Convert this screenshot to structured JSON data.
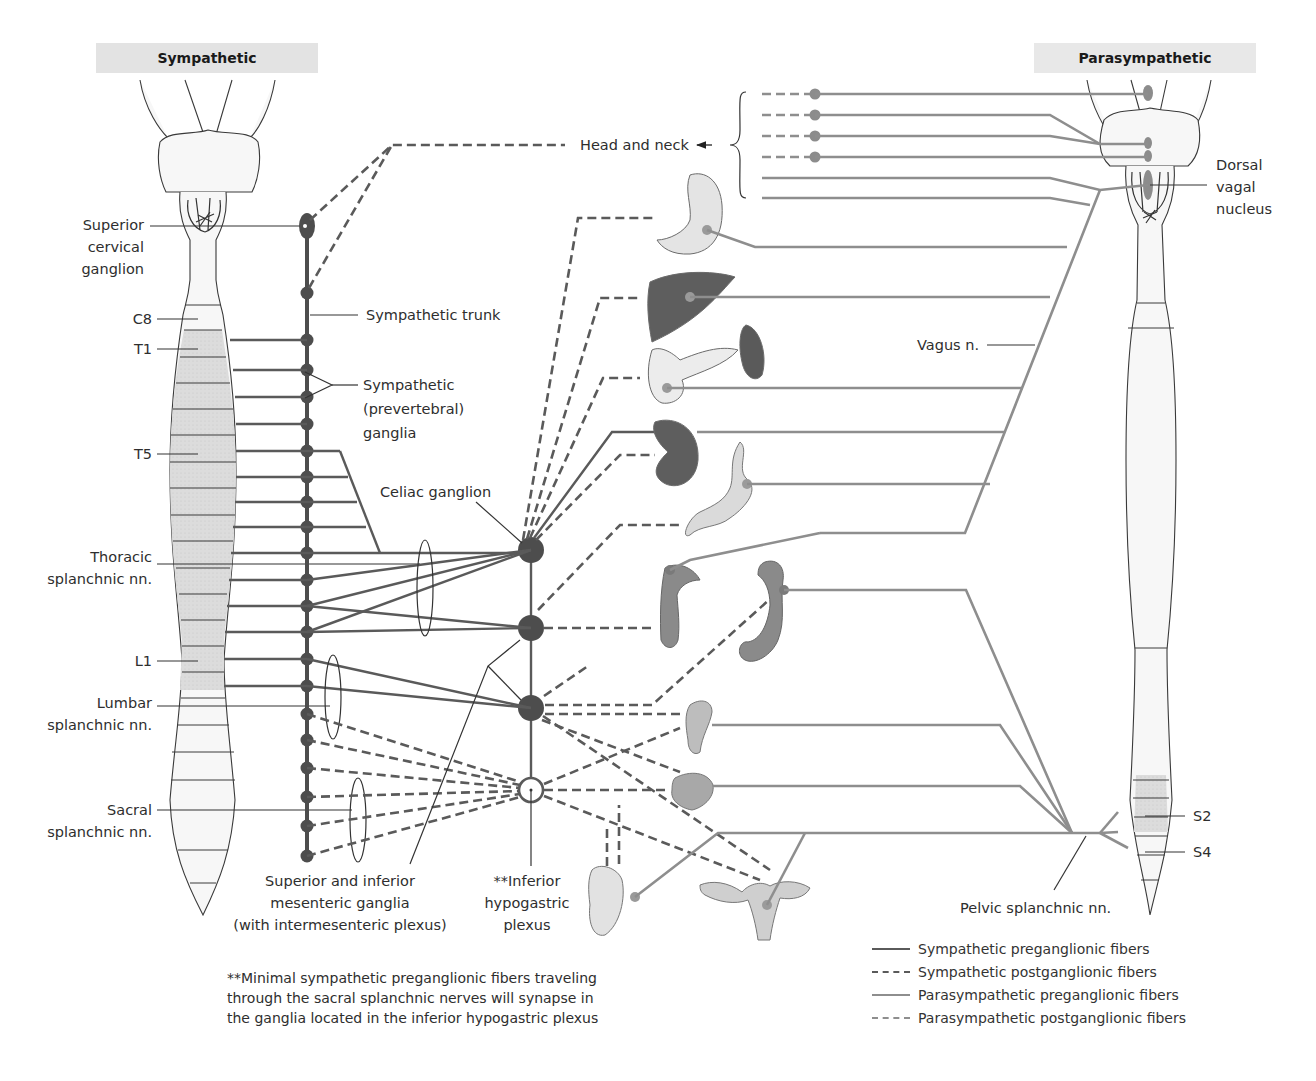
{
  "headers": {
    "sympathetic": "Sympathetic",
    "parasympathetic": "Parasympathetic"
  },
  "labels": {
    "superior_cervical_ganglion": [
      "Superior",
      "cervical",
      "ganglion"
    ],
    "c8": "C8",
    "t1": "T1",
    "t5": "T5",
    "l1": "L1",
    "thoracic_splanchnic": [
      "Thoracic",
      "splanchnic nn."
    ],
    "lumbar_splanchnic": [
      "Lumbar",
      "splanchnic nn."
    ],
    "sacral_splanchnic": [
      "Sacral",
      "splanchnic nn."
    ],
    "sympathetic_trunk": "Sympathetic trunk",
    "sympathetic_ganglia": [
      "Sympathetic",
      "(prevertebral)",
      "ganglia"
    ],
    "celiac_ganglion": "Celiac ganglion",
    "mesenteric_ganglia": [
      "Superior and inferior",
      "mesenteric ganglia",
      "(with intermesenteric plexus)"
    ],
    "inferior_hypogastric": [
      "**Inferior",
      "hypogastric",
      "plexus"
    ],
    "head_and_neck": "Head and neck",
    "dorsal_vagal_nucleus": [
      "Dorsal",
      "vagal",
      "nucleus"
    ],
    "vagus": "Vagus n.",
    "s2": "S2",
    "s4": "S4",
    "pelvic_splanchnic": "Pelvic splanchnic nn."
  },
  "footnote": [
    "**Minimal sympathetic preganglionic fibers traveling",
    "through the sacral splanchnic nerves will synapse in",
    "the ganglia located in the inferior hypogastric plexus"
  ],
  "legend": [
    {
      "label": "Sympathetic preganglionic fibers",
      "color": "#5a5a5a",
      "style": "solid"
    },
    {
      "label": "Sympathetic postganglionic fibers",
      "color": "#5a5a5a",
      "style": "dashed"
    },
    {
      "label": "Parasympathetic preganglionic fibers",
      "color": "#8e8e8e",
      "style": "solid"
    },
    {
      "label": "Parasympathetic postganglionic fibers",
      "color": "#8e8e8e",
      "style": "dashed"
    }
  ],
  "organs": [
    "eye-and-glands",
    "stomach",
    "liver",
    "pancreas",
    "spleen",
    "kidney",
    "small-intestine",
    "large-intestine-ascending",
    "large-intestine-descending",
    "rectum",
    "bladder",
    "male-genitalia",
    "female-reproductive-organs"
  ],
  "colors": {
    "sympathetic": "#5a5a5a",
    "parasympathetic": "#8e8e8e",
    "header_band": "#e3e3e3",
    "cord_shading": "#dcdcdc"
  }
}
